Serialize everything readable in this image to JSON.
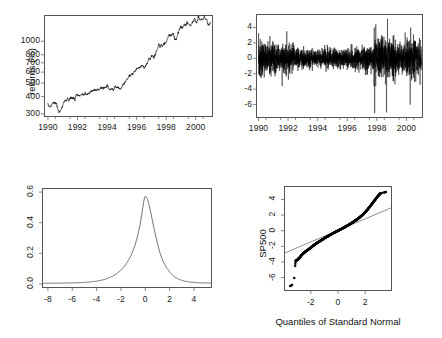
{
  "figure": {
    "title": "",
    "background": "#ffffff",
    "layout": "2x2 panel grid",
    "width": 442,
    "height": 338
  },
  "chart_data": [
    {
      "id": "sp500-price",
      "type": "line",
      "title": "",
      "xlabel": "",
      "ylabel": "",
      "panel": "top-left",
      "grid": false,
      "legend": null,
      "yscale": "log",
      "xlim": [
        1989.8,
        2001.1
      ],
      "ylim": [
        290,
        1520
      ],
      "xticks": [
        "1990",
        "1992",
        "1994",
        "1996",
        "1998",
        "2000"
      ],
      "xtick_values": [
        1990,
        1992,
        1994,
        1996,
        1998,
        2000
      ],
      "yticks": [
        "300",
        "400",
        "500",
        "600",
        "700",
        "800",
        "1000"
      ],
      "ytick_values": [
        300,
        400,
        500,
        600,
        700,
        800,
        1000
      ],
      "x": [
        1990.0,
        1990.08,
        1990.17,
        1990.25,
        1990.33,
        1990.42,
        1990.5,
        1990.58,
        1990.67,
        1990.75,
        1990.83,
        1990.92,
        1991.0,
        1991.08,
        1991.17,
        1991.25,
        1991.33,
        1991.42,
        1991.5,
        1991.58,
        1991.67,
        1991.75,
        1991.83,
        1991.92,
        1992.0,
        1992.08,
        1992.17,
        1992.25,
        1992.33,
        1992.42,
        1992.5,
        1992.58,
        1992.67,
        1992.75,
        1992.83,
        1992.92,
        1993.0,
        1993.08,
        1993.17,
        1993.25,
        1993.33,
        1993.42,
        1993.5,
        1993.58,
        1993.67,
        1993.75,
        1993.83,
        1993.92,
        1994.0,
        1994.08,
        1994.17,
        1994.25,
        1994.33,
        1994.42,
        1994.5,
        1994.58,
        1994.67,
        1994.75,
        1994.83,
        1994.92,
        1995.0,
        1995.08,
        1995.17,
        1995.25,
        1995.33,
        1995.42,
        1995.5,
        1995.58,
        1995.67,
        1995.75,
        1995.83,
        1995.92,
        1996.0,
        1996.08,
        1996.17,
        1996.25,
        1996.33,
        1996.42,
        1996.5,
        1996.58,
        1996.67,
        1996.75,
        1996.83,
        1996.92,
        1997.0,
        1997.08,
        1997.17,
        1997.25,
        1997.33,
        1997.42,
        1997.5,
        1997.58,
        1997.67,
        1997.75,
        1997.83,
        1997.92,
        1998.0,
        1998.08,
        1998.17,
        1998.25,
        1998.33,
        1998.42,
        1998.5,
        1998.58,
        1998.67,
        1998.75,
        1998.83,
        1998.92,
        1999.0,
        1999.08,
        1999.17,
        1999.25,
        1999.33,
        1999.42,
        1999.5,
        1999.58,
        1999.67,
        1999.75,
        1999.83,
        1999.92,
        2000.0,
        2000.08,
        2000.17,
        2000.25,
        2000.33,
        2000.42,
        2000.5,
        2000.58,
        2000.67,
        2000.75,
        2000.83,
        2000.92,
        2001.0
      ],
      "values": [
        353,
        340,
        338,
        348,
        361,
        363,
        358,
        356,
        322,
        307,
        315,
        330,
        343,
        367,
        375,
        375,
        389,
        371,
        387,
        395,
        387,
        392,
        375,
        417,
        408,
        412,
        403,
        414,
        415,
        408,
        424,
        414,
        418,
        419,
        431,
        436,
        439,
        443,
        451,
        440,
        450,
        450,
        448,
        463,
        459,
        467,
        462,
        466,
        482,
        467,
        445,
        450,
        457,
        444,
        458,
        475,
        462,
        472,
        453,
        459,
        470,
        487,
        500,
        514,
        533,
        544,
        562,
        562,
        584,
        581,
        605,
        615,
        636,
        640,
        645,
        654,
        669,
        670,
        639,
        651,
        687,
        705,
        757,
        740,
        786,
        790,
        757,
        801,
        848,
        885,
        954,
        899,
        947,
        914,
        955,
        970,
        980,
        1049,
        1101,
        1111,
        1090,
        1133,
        1120,
        1027,
        1017,
        1098,
        1163,
        1229,
        1279,
        1238,
        1286,
        1335,
        1301,
        1372,
        1328,
        1320,
        1282,
        1362,
        1388,
        1469,
        1394,
        1366,
        1498,
        1452,
        1420,
        1454,
        1430,
        1517,
        1436,
        1429,
        1314,
        1320,
        1366
      ]
    },
    {
      "id": "sp500-returns",
      "type": "line",
      "title": "",
      "xlabel": "",
      "ylabel": "returns (%)",
      "panel": "top-right",
      "grid": false,
      "legend": null,
      "xlim": [
        1989.9,
        2001.05
      ],
      "ylim": [
        -7.6,
        5.6
      ],
      "xticks": [
        "1990",
        "1992",
        "1994",
        "1996",
        "1998",
        "2000"
      ],
      "xtick_values": [
        1990,
        1992,
        1994,
        1996,
        1998,
        2000
      ],
      "yticks": [
        "4",
        "2",
        "0",
        "-2",
        "-4",
        "-6"
      ],
      "ytick_values": [
        4,
        2,
        0,
        -2,
        -4,
        -6
      ],
      "description": "Daily percentage returns; volatility clustering with larger swings in 1990, 1997-1998 and 2000-2001",
      "n_points": 2800,
      "std_baseline": 0.72,
      "notable_spikes": [
        {
          "year": 1997.85,
          "value": -7.1
        },
        {
          "year": 1998.65,
          "value": -7.0
        },
        {
          "year": 1998.72,
          "value": 5.1
        },
        {
          "year": 2000.25,
          "value": -6.0
        },
        {
          "year": 1991.6,
          "value": -3.6
        }
      ]
    },
    {
      "id": "returns-density",
      "type": "line",
      "title": "",
      "xlabel": "",
      "ylabel": "",
      "panel": "bottom-left",
      "grid": false,
      "legend": null,
      "xlim": [
        -8.4,
        5.4
      ],
      "ylim": [
        -0.02,
        0.62
      ],
      "xticks": [
        "-8",
        "-6",
        "-4",
        "-2",
        "0",
        "2",
        "4"
      ],
      "xtick_values": [
        -8,
        -6,
        -4,
        -2,
        0,
        2,
        4
      ],
      "yticks": [
        "0.0",
        "0.2",
        "0.4",
        "0.6"
      ],
      "ytick_values": [
        0.0,
        0.2,
        0.4,
        0.6
      ],
      "description": "Kernel density estimate of daily returns, leptokurtic with peak near 0",
      "peak_x": -0.05,
      "peak_y": 0.572,
      "x": [
        -8.4,
        -8.0,
        -7.5,
        -7.0,
        -6.5,
        -6.0,
        -5.5,
        -5.0,
        -4.5,
        -4.0,
        -3.6,
        -3.2,
        -2.8,
        -2.4,
        -2.0,
        -1.7,
        -1.4,
        -1.2,
        -1.0,
        -0.85,
        -0.7,
        -0.55,
        -0.42,
        -0.3,
        -0.2,
        -0.1,
        -0.05,
        0.0,
        0.08,
        0.18,
        0.3,
        0.42,
        0.55,
        0.7,
        0.85,
        1.0,
        1.2,
        1.45,
        1.7,
        2.0,
        2.4,
        2.8,
        3.2,
        3.6,
        4.0,
        4.5,
        5.0,
        5.4
      ],
      "values": [
        0.004,
        0.004,
        0.005,
        0.005,
        0.006,
        0.007,
        0.008,
        0.01,
        0.013,
        0.018,
        0.024,
        0.033,
        0.046,
        0.064,
        0.09,
        0.116,
        0.152,
        0.181,
        0.217,
        0.25,
        0.292,
        0.34,
        0.39,
        0.447,
        0.499,
        0.549,
        0.566,
        0.572,
        0.57,
        0.553,
        0.52,
        0.478,
        0.428,
        0.37,
        0.316,
        0.266,
        0.205,
        0.15,
        0.112,
        0.078,
        0.046,
        0.029,
        0.019,
        0.013,
        0.01,
        0.007,
        0.006,
        0.005
      ]
    },
    {
      "id": "sp500-qqnorm",
      "type": "scatter",
      "title": "",
      "xlabel": "Quantiles of Standard Normal",
      "ylabel": "SP500",
      "panel": "bottom-right",
      "grid": false,
      "legend": null,
      "xlim": [
        -3.9,
        3.9
      ],
      "ylim": [
        -7.6,
        5.6
      ],
      "xticks": [
        "-2",
        "0",
        "2"
      ],
      "xtick_values": [
        -2,
        0,
        2
      ],
      "yticks": [
        "4",
        "2",
        "0",
        "-2",
        "-4",
        "-6"
      ],
      "ytick_values": [
        4,
        2,
        0,
        -2,
        -4,
        -6
      ],
      "description": "Normal Q-Q plot of SP500 daily returns with reference line; heavy tails at both ends",
      "reference_line": {
        "intercept": 0.04,
        "slope": 0.74
      },
      "points_x": [
        -3.52,
        -3.45,
        -3.38,
        -3.22,
        -3.12,
        -3.05,
        -2.98,
        -2.92,
        -2.86,
        -2.8,
        -2.72,
        -2.64,
        -2.56,
        -2.48,
        -2.4,
        -2.32,
        -2.24,
        -2.16,
        -2.08,
        -2.0,
        -1.9,
        -1.8,
        -1.7,
        -1.6,
        -1.5,
        -1.4,
        -1.3,
        -1.2,
        -1.1,
        -1.0,
        -0.9,
        -0.8,
        -0.7,
        -0.6,
        -0.5,
        -0.4,
        -0.3,
        -0.2,
        -0.1,
        0.0,
        0.1,
        0.2,
        0.3,
        0.4,
        0.5,
        0.6,
        0.7,
        0.8,
        0.9,
        1.0,
        1.1,
        1.2,
        1.3,
        1.4,
        1.5,
        1.6,
        1.7,
        1.8,
        1.9,
        2.0,
        2.08,
        2.16,
        2.24,
        2.32,
        2.4,
        2.48,
        2.56,
        2.64,
        2.72,
        2.8,
        2.86,
        2.92,
        2.98,
        3.05,
        3.12,
        3.22,
        3.38,
        3.45,
        3.52
      ],
      "points_y": [
        -7.1,
        -7.02,
        -6.95,
        -6.05,
        -3.85,
        -3.8,
        -3.72,
        -3.62,
        -3.5,
        -3.4,
        -3.22,
        -3.05,
        -2.92,
        -2.8,
        -2.68,
        -2.58,
        -2.48,
        -2.38,
        -2.28,
        -2.18,
        -2.02,
        -1.88,
        -1.76,
        -1.64,
        -1.52,
        -1.41,
        -1.3,
        -1.19,
        -1.08,
        -0.97,
        -0.86,
        -0.76,
        -0.66,
        -0.56,
        -0.46,
        -0.37,
        -0.27,
        -0.18,
        -0.09,
        0.0,
        0.09,
        0.18,
        0.27,
        0.37,
        0.46,
        0.56,
        0.66,
        0.76,
        0.87,
        0.98,
        1.09,
        1.21,
        1.33,
        1.45,
        1.58,
        1.72,
        1.86,
        2.01,
        2.18,
        2.36,
        2.52,
        2.68,
        2.86,
        3.04,
        3.22,
        3.4,
        3.58,
        3.76,
        3.94,
        4.12,
        4.26,
        4.4,
        4.52,
        4.64,
        4.78,
        4.84,
        4.9,
        4.92,
        4.95
      ]
    }
  ],
  "panels": {
    "price": {
      "name": "SP500 index level",
      "xticks": [
        "1990",
        "1992",
        "1994",
        "1996",
        "1998",
        "2000"
      ],
      "yticks": [
        "300",
        "400",
        "500",
        "600",
        "700",
        "800",
        "1000"
      ]
    },
    "returns": {
      "name": "SP500 daily returns",
      "ylabel": "returns (%)",
      "xticks": [
        "1990",
        "1992",
        "1994",
        "1996",
        "1998",
        "2000"
      ],
      "yticks": [
        "4",
        "2",
        "0",
        "-2",
        "-4",
        "-6"
      ]
    },
    "density": {
      "name": "Density of returns",
      "xticks": [
        "-8",
        "-6",
        "-4",
        "-2",
        "0",
        "2",
        "4"
      ],
      "yticks": [
        "0.0",
        "0.2",
        "0.4",
        "0.6"
      ]
    },
    "qq": {
      "name": "Normal Q-Q plot",
      "ylabel": "SP500",
      "xlabel": "Quantiles of Standard Normal",
      "xticks": [
        "-2",
        "0",
        "2"
      ],
      "yticks": [
        "4",
        "2",
        "0",
        "-2",
        "-4",
        "-6"
      ]
    }
  }
}
